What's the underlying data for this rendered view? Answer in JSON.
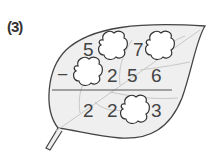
{
  "problem": {
    "number_label": "(3)",
    "operator": "−",
    "minuend": [
      "5",
      "",
      "7",
      ""
    ],
    "subtrahend": [
      "",
      "2",
      "5",
      "6"
    ],
    "difference": [
      "2",
      "2",
      "",
      "3"
    ],
    "blank_shape": "cloud",
    "background_shape": "leaf"
  }
}
